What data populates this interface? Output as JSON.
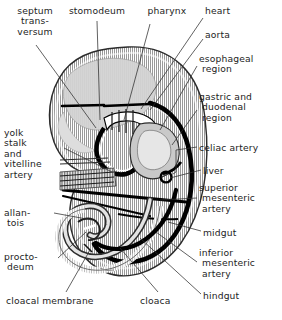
{
  "figure": {
    "type": "anatomical-line-diagram",
    "background_color": "#ffffff",
    "ink_color": "#1d1d1d",
    "body_fill_color": "#d9d9d9",
    "organ_fill_color": "#bdbdbd",
    "vessel_color": "#000000"
  },
  "labels": [
    {
      "id": "septum-transversum",
      "text": "septum\ntrans-\nversum",
      "align": "center",
      "x": 4,
      "y": 6,
      "w": 62
    },
    {
      "id": "stomodeum",
      "text": "stomodeum",
      "align": "center",
      "x": 60,
      "y": 6,
      "w": 74
    },
    {
      "id": "pharynx",
      "text": "pharynx",
      "align": "center",
      "x": 138,
      "y": 6,
      "w": 58
    },
    {
      "id": "heart",
      "text": "heart",
      "align": "left",
      "x": 205,
      "y": 6,
      "w": 60
    },
    {
      "id": "aorta",
      "text": "aorta",
      "align": "left",
      "x": 205,
      "y": 30,
      "w": 60
    },
    {
      "id": "esophageal-region",
      "text": "esophageal\n region",
      "align": "left",
      "x": 199,
      "y": 54,
      "w": 80
    },
    {
      "id": "gastric-duodenal",
      "text": "gastric and\n duodenal\n region",
      "align": "left",
      "x": 199,
      "y": 92,
      "w": 82
    },
    {
      "id": "celiac-artery",
      "text": "celiac artery",
      "align": "left",
      "x": 199,
      "y": 143,
      "w": 82
    },
    {
      "id": "liver",
      "text": "liver",
      "align": "left",
      "x": 203,
      "y": 166,
      "w": 70
    },
    {
      "id": "superior-mesenteric",
      "text": "superior\n mesenteric\n artery",
      "align": "left",
      "x": 199,
      "y": 183,
      "w": 82
    },
    {
      "id": "midgut",
      "text": "midgut",
      "align": "left",
      "x": 203,
      "y": 228,
      "w": 70
    },
    {
      "id": "inferior-mesenteric",
      "text": "inferior\n mesenteric\n artery",
      "align": "left",
      "x": 199,
      "y": 248,
      "w": 82
    },
    {
      "id": "hindgut",
      "text": "hindgut",
      "align": "left",
      "x": 203,
      "y": 291,
      "w": 70
    },
    {
      "id": "yolk-stalk",
      "text": "yolk\nstalk\nand\nvitelline\nartery",
      "align": "left",
      "x": 4,
      "y": 128,
      "w": 58
    },
    {
      "id": "allantois",
      "text": "allan-\n tois",
      "align": "left",
      "x": 4,
      "y": 208,
      "w": 48
    },
    {
      "id": "proctodeum",
      "text": "procto-\n deum",
      "align": "left",
      "x": 4,
      "y": 252,
      "w": 52
    },
    {
      "id": "cloacal-membrane",
      "text": "cloacal membrane",
      "align": "left",
      "x": 6,
      "y": 296,
      "w": 112
    },
    {
      "id": "cloaca",
      "text": "cloaca",
      "align": "left",
      "x": 140,
      "y": 296,
      "w": 52
    }
  ]
}
